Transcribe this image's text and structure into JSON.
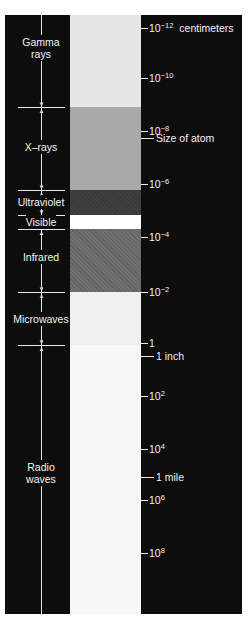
{
  "diagram": {
    "units_label": "centimeters",
    "bands": [
      {
        "name": "Gamma rays",
        "line1": "Gamma",
        "line2": "rays",
        "top": 15,
        "bottom": 107,
        "color": "#e6e6e6",
        "label_y": 36
      },
      {
        "name": "X-rays",
        "line1": "X–rays",
        "line2": "",
        "top": 107,
        "bottom": 190,
        "color": "#a9a9a9",
        "label_y": 141
      },
      {
        "name": "Ultraviolet",
        "line1": "Ultraviolet",
        "line2": "",
        "top": 190,
        "bottom": 215,
        "color": "#3f3f3f",
        "label_y": 196
      },
      {
        "name": "Visible",
        "line1": "Visible",
        "line2": "",
        "top": 215,
        "bottom": 229,
        "color": "#ffffff",
        "label_y": 216
      },
      {
        "name": "Infrared",
        "line1": "Infrared",
        "line2": "",
        "top": 229,
        "bottom": 292,
        "color": "#6f6f6f",
        "label_y": 251
      },
      {
        "name": "Microwaves",
        "line1": "Microwaves",
        "line2": "",
        "top": 292,
        "bottom": 345,
        "color": "#f0f0f0",
        "label_y": 313
      },
      {
        "name": "Radio waves",
        "line1": "Radio",
        "line2": "waves",
        "top": 345,
        "bottom": 614,
        "color": "#f7f7f7",
        "label_y": 461
      }
    ],
    "ticks": [
      {
        "base": "10",
        "exp": "−12",
        "suffix": "centimeters",
        "y": 28
      },
      {
        "base": "10",
        "exp": "−10",
        "suffix": "",
        "y": 78
      },
      {
        "base": "10",
        "exp": "−8",
        "suffix": "",
        "y": 131
      },
      {
        "base": "10",
        "exp": "−6",
        "suffix": "",
        "y": 184
      },
      {
        "base": "10",
        "exp": "−4",
        "suffix": "",
        "y": 237
      },
      {
        "base": "10",
        "exp": "−2",
        "suffix": "",
        "y": 292
      },
      {
        "base": "1",
        "exp": "",
        "suffix": "",
        "y": 343
      },
      {
        "base": "10",
        "exp": "2",
        "suffix": "",
        "y": 396
      },
      {
        "base": "10",
        "exp": "4",
        "suffix": "",
        "y": 449
      },
      {
        "base": "10",
        "exp": "6",
        "suffix": "",
        "y": 500
      },
      {
        "base": "10",
        "exp": "8",
        "suffix": "",
        "y": 553
      }
    ],
    "annotations": [
      {
        "text": "Size of atom",
        "y": 138
      },
      {
        "text": "1 inch",
        "y": 356
      },
      {
        "text": "1 mile",
        "y": 477
      }
    ],
    "dividers_y": [
      107,
      190,
      215,
      229,
      292,
      345
    ]
  }
}
